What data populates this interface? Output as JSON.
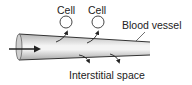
{
  "diagram": {
    "labels": {
      "cell_1": "Cell",
      "cell_2": "Cell",
      "vessel": "Blood vessel",
      "interstitial": "Interstitial space"
    },
    "colors": {
      "stroke": "#333333",
      "vessel_light": "#f2f2f2",
      "vessel_dark": "#b8b8b8"
    }
  }
}
